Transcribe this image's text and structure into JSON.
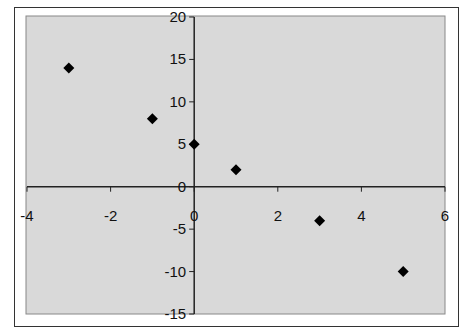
{
  "chart_data": {
    "type": "scatter",
    "title": "",
    "xlabel": "",
    "ylabel": "",
    "xlim": [
      -4,
      6
    ],
    "ylim": [
      -15,
      20
    ],
    "x_ticks": [
      -4,
      -2,
      0,
      2,
      4,
      6
    ],
    "y_ticks": [
      20,
      15,
      10,
      5,
      0,
      -5,
      -10,
      -15
    ],
    "x_tick_labels": [
      "-4",
      "-2",
      "0",
      "2",
      "4",
      "6"
    ],
    "y_tick_labels": [
      "20",
      "15",
      "10",
      "5",
      "0",
      "-5",
      "-10",
      "-15"
    ],
    "grid": false,
    "legend": null,
    "marker": "diamond",
    "plot_background": "#d9d9d9",
    "marker_color": "#000000",
    "series": [
      {
        "name": "Series1",
        "points": [
          {
            "x": -3,
            "y": 14
          },
          {
            "x": -1,
            "y": 8
          },
          {
            "x": 0,
            "y": 5
          },
          {
            "x": 1,
            "y": 2
          },
          {
            "x": 3,
            "y": -4
          },
          {
            "x": 5,
            "y": -10
          }
        ]
      }
    ]
  }
}
